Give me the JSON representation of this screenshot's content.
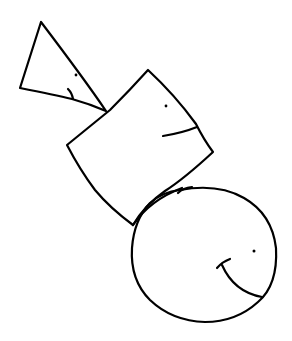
{
  "drawing": {
    "description": "Hand-drawn doodle of three smiling shapes stacked diagonally: a triangle, a square and a circle",
    "stroke_color": "#000000",
    "background": "#ffffff",
    "shapes": [
      {
        "name": "triangle",
        "has_eye": true,
        "has_mouth": true
      },
      {
        "name": "square",
        "has_eye": true,
        "has_mouth": true
      },
      {
        "name": "circle",
        "has_eye": true,
        "has_mouth": true
      }
    ]
  }
}
